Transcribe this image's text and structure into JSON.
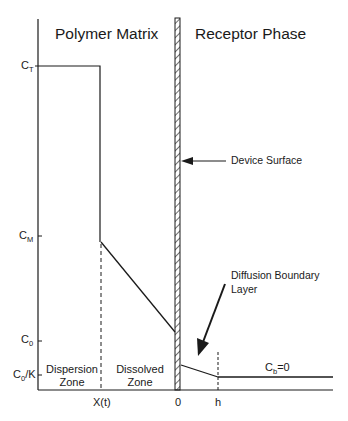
{
  "diagram": {
    "regions": {
      "left_title": "Polymer Matrix",
      "right_title": "Receptor Phase"
    },
    "y_axis_labels": {
      "ct": {
        "main": "C",
        "sub": "T"
      },
      "cm": {
        "main": "C",
        "sub": "M"
      },
      "c0": {
        "main": "C",
        "sub": "0"
      },
      "c0k": {
        "main": "C",
        "sub": "0",
        "suffix": "/K"
      }
    },
    "x_axis_labels": {
      "xt": "X(t)",
      "zero": "0",
      "h": "h"
    },
    "zones": {
      "dispersion_line1": "Dispersion",
      "dispersion_line2": "Zone",
      "dissolved_line1": "Dissolved",
      "dissolved_line2": "Zone"
    },
    "annotations": {
      "device_surface": "Device Surface",
      "diffusion_line1": "Diffusion Boundary",
      "diffusion_line2": "Layer",
      "cb": {
        "main": "C",
        "sub": "b",
        "suffix": "=0"
      }
    },
    "colors": {
      "ink": "#1a1a1a",
      "background": "#ffffff"
    }
  }
}
